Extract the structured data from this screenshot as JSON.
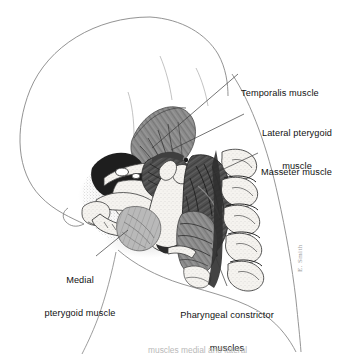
{
  "figure": {
    "background_color": "#ffffff",
    "ink_color": "#1a1a1a",
    "outline_color": "#6e6e6e",
    "muscle_dark_color": "#4a4a4a",
    "muscle_mid_color": "#7b7b7b",
    "muscle_light_color": "#b4b4b4",
    "bone_fill_color": "#f2f0ec",
    "shadow_color": "#2a2a2a",
    "leader_line_color": "#3a3a3a",
    "signature": "E. Smith"
  },
  "labels": [
    {
      "id": "temporalis",
      "name": "label-temporalis-muscle",
      "text": "Temporalis muscle",
      "lines": [
        "Temporalis muscle"
      ],
      "align": "left",
      "x": 241,
      "y": 66,
      "leader": {
        "x1": 238,
        "y1": 74,
        "x2": 152,
        "y2": 148
      }
    },
    {
      "id": "lateral-pterygoid",
      "name": "label-lateral-pterygoid-muscle",
      "text": "Lateral pterygoid muscle",
      "lines": [
        "Lateral pterygoid",
        "muscle"
      ],
      "align": "center",
      "x": 247,
      "y": 106,
      "leader": {
        "x1": 244,
        "y1": 114,
        "x2": 171,
        "y2": 150
      }
    },
    {
      "id": "masseter",
      "name": "label-masseter-muscle",
      "text": "Masseter muscle",
      "lines": [
        "Masseter muscle"
      ],
      "align": "left",
      "x": 261,
      "y": 145,
      "leader": {
        "x1": 258,
        "y1": 153,
        "x2": 213,
        "y2": 174
      }
    },
    {
      "id": "medial-pterygoid",
      "name": "label-medial-pterygoid-muscle",
      "text": "Medial pterygoid muscle",
      "lines": [
        "Medial",
        "pterygoid muscle"
      ],
      "align": "center",
      "x": 30,
      "y": 253,
      "leader": {
        "x1": 96,
        "y1": 256,
        "x2": 120,
        "y2": 232
      }
    },
    {
      "id": "pharyngeal-constrictor",
      "name": "label-pharyngeal-constrictor-muscles",
      "text": "Pharyngeal constrictor muscles",
      "lines": [
        "Pharyngeal constrictor",
        "muscles"
      ],
      "align": "center",
      "x": 176,
      "y": 288,
      "leader": {
        "x1": 227,
        "y1": 286,
        "x2": 214,
        "y2": 249
      }
    }
  ],
  "caption": {
    "text": "muscles medial and lateral",
    "visible": "partially cropped at bottom edge"
  },
  "structures": [
    {
      "name": "cranium-outline",
      "label": "Cranial vault (skull outline)"
    },
    {
      "name": "temporalis-muscle-shape",
      "label": "Temporalis muscle"
    },
    {
      "name": "lateral-pterygoid-muscle-shape",
      "label": "Lateral pterygoid muscle"
    },
    {
      "name": "masseter-muscle-shape",
      "label": "Masseter muscle"
    },
    {
      "name": "medial-pterygoid-muscle-shape",
      "label": "Medial pterygoid muscle"
    },
    {
      "name": "pharyngeal-constrictor-muscle-shape",
      "label": "Pharyngeal constrictor muscles"
    },
    {
      "name": "mandible-shape",
      "label": "Mandible"
    },
    {
      "name": "maxilla-shape",
      "label": "Maxilla"
    },
    {
      "name": "zygomatic-arch-shape",
      "label": "Zygomatic arch"
    },
    {
      "name": "cervical-vertebrae-shape",
      "label": "Cervical vertebrae"
    },
    {
      "name": "hyoid-shape",
      "label": "Hyoid bone"
    },
    {
      "name": "neck-contour",
      "label": "Neck and face soft-tissue contour"
    }
  ]
}
